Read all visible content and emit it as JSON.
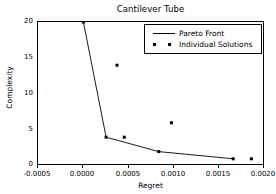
{
  "chart_data": {
    "type": "line",
    "title": "Cantilever Tube",
    "xlabel": "Regret",
    "ylabel": "Complexity",
    "xlim": [
      -0.0005,
      0.002
    ],
    "ylim": [
      0,
      20
    ],
    "grid": false,
    "legend_position": "upper right",
    "xticks": [
      "-0.0005",
      "0.0000",
      "0.0005",
      "0.0010",
      "0.0015",
      "0.0020"
    ],
    "xtick_values": [
      -0.0005,
      0.0,
      0.0005,
      0.001,
      0.0015,
      0.002
    ],
    "yticks": [
      "0",
      "5",
      "10",
      "15",
      "20"
    ],
    "ytick_values": [
      0,
      5,
      10,
      15,
      20
    ],
    "series": [
      {
        "name": "Pareto Front",
        "style": "line",
        "x": [
          0.0,
          0.00025,
          0.00083,
          0.00165
        ],
        "y": [
          20,
          4,
          2,
          1
        ]
      },
      {
        "name": "Individual Solutions",
        "style": "scatter",
        "x": [
          0.0,
          0.00025,
          0.00037,
          0.00045,
          0.00083,
          0.00097,
          0.00165,
          0.00185
        ],
        "y": [
          20,
          4,
          14,
          4,
          2,
          6,
          1,
          1
        ]
      }
    ]
  },
  "legend": {
    "entries": [
      {
        "label": "Pareto Front",
        "marker": "line"
      },
      {
        "label": "Individual Solutions",
        "marker": "dots"
      }
    ]
  }
}
